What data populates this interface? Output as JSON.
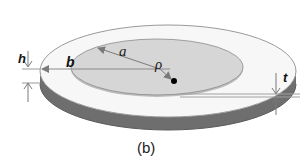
{
  "figure": {
    "caption": "(b)",
    "labels": {
      "h": "h",
      "b": "b",
      "a": "a",
      "rho": "ρ",
      "t": "t"
    },
    "colors": {
      "background": "#ffffff",
      "outer_disk_top": "#f7f7f7",
      "outer_disk_outline": "#9a9a9a",
      "outer_disk_side": "#6e6e6e",
      "inner_disk": "#d6d6d6",
      "inner_disk_outline": "#8a8a8a",
      "arrow": "#7a7a7a",
      "point": "#000000"
    }
  }
}
